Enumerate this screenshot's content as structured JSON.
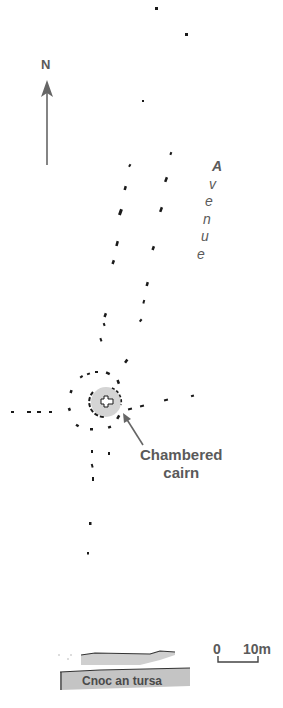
{
  "diagram": {
    "type": "archaeological site plan",
    "colors": {
      "background": "#ffffff",
      "stones": "#1a1a1a",
      "label_text": "#5a5a5a",
      "cairn_fill": "#d4d4d4",
      "hill_fill": "#c8c8c8",
      "arrow": "#666666"
    },
    "north_arrow": {
      "label": "N",
      "icon": "north-arrow-icon"
    },
    "labels": {
      "avenue": [
        "A",
        "v",
        "e",
        "n",
        "u",
        "e"
      ],
      "chambered_cairn": [
        "Chambered",
        "cairn"
      ],
      "hill": "Cnoc an tursa"
    },
    "scale_bar": {
      "start_label": "0",
      "end_label": "10m"
    }
  }
}
